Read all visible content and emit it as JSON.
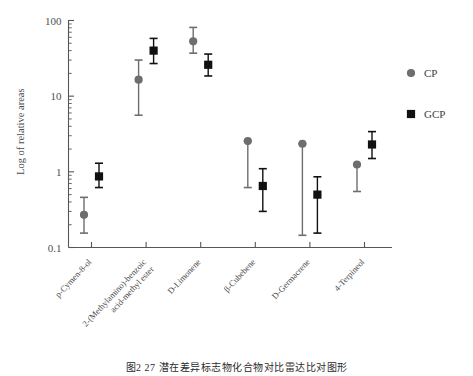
{
  "figure": {
    "caption": "图2  27  潜在差异标志物化合物对比雷达比对图形"
  },
  "legend": {
    "position": "right",
    "entries": [
      {
        "label": "CP",
        "marker": "circle",
        "color": "#6e6e6e"
      },
      {
        "label": "GCP",
        "marker": "square",
        "color": "#111111"
      }
    ]
  },
  "chart_data": {
    "type": "scatter",
    "title": "",
    "xlabel": "",
    "ylabel": "Log of relative areas",
    "yscale": "log",
    "ylim": [
      0.1,
      100
    ],
    "ytick_labels": [
      "0.1",
      "1",
      "10",
      "100"
    ],
    "ytick_values": [
      0.1,
      1,
      10,
      100
    ],
    "grid": false,
    "minor_ticks": true,
    "categories": [
      "p-Cymen-8-ol",
      "2-(Methylamino)-benzoic acid-methyl ester",
      "D-Limonene",
      "β-Cubebene",
      "D-Germacrene",
      "4-Terpineol"
    ],
    "category_lines": [
      [
        "p-Cymen-8-ol"
      ],
      [
        "2-(Methylamino)-benzoic",
        "acid-methyl ester"
      ],
      [
        "D-Limonene"
      ],
      [
        "β-Cubebene"
      ],
      [
        "D-Germacrene"
      ],
      [
        "4-Terpineol"
      ]
    ],
    "series": [
      {
        "name": "CP",
        "marker": "circle",
        "color": "#6e6e6e",
        "values": [
          0.27,
          16.5,
          53.0,
          2.55,
          2.35,
          1.25
        ],
        "err_low": [
          0.155,
          5.6,
          37.0,
          0.62,
          0.145,
          0.55
        ],
        "err_high": [
          0.46,
          30.0,
          81.0,
          2.55,
          2.35,
          1.25
        ]
      },
      {
        "name": "GCP",
        "marker": "square",
        "color": "#111111",
        "values": [
          0.87,
          40.0,
          26.0,
          0.65,
          0.5,
          2.3
        ],
        "err_low": [
          0.62,
          27.0,
          18.5,
          0.3,
          0.155,
          1.5
        ],
        "err_high": [
          1.3,
          58.0,
          36.0,
          1.1,
          0.86,
          3.4
        ]
      }
    ]
  },
  "axes": {
    "y_axis_title": "Log of relative areas"
  }
}
